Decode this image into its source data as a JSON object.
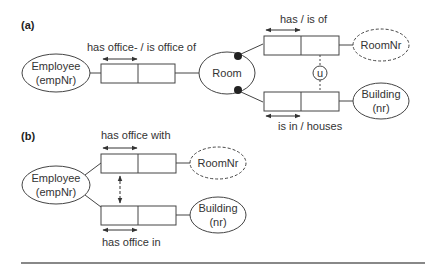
{
  "diagram": {
    "part_a": {
      "label": "(a)",
      "entities": {
        "employee": {
          "line1": "Employee",
          "line2": "(empNr)"
        },
        "room": {
          "line1": "Room"
        },
        "roomnr": {
          "line1": "RoomNr"
        },
        "building": {
          "line1": "Building",
          "line2": "(nr)"
        }
      },
      "facts": {
        "office": "has office- / is office of",
        "has_is_of": "has / is of",
        "is_in": "is in / houses"
      },
      "constraint": "u"
    },
    "part_b": {
      "label": "(b)",
      "entities": {
        "employee": {
          "line1": "Employee",
          "line2": "(empNr)"
        },
        "roomnr": {
          "line1": "RoomNr"
        },
        "building": {
          "line1": "Building",
          "line2": "(nr)"
        }
      },
      "facts": {
        "office_with": "has office with",
        "office_in": "has office in"
      }
    },
    "colors": {
      "stroke": "#444444",
      "text": "#333333",
      "rule": "#888888"
    }
  }
}
